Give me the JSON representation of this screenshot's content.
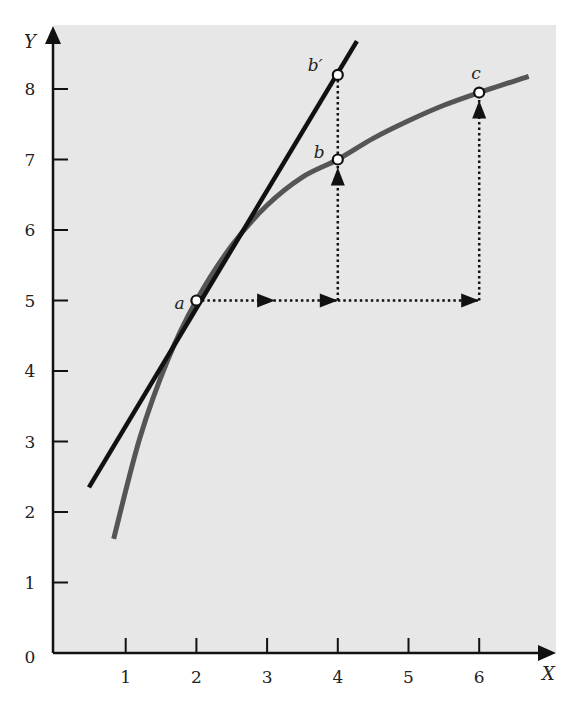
{
  "chart_data": {
    "type": "line",
    "title": "",
    "xlabel": "X",
    "ylabel": "Y",
    "xlim": [
      0,
      7
    ],
    "ylim": [
      0,
      8.8
    ],
    "grid": false,
    "x_ticks": [
      1,
      2,
      3,
      4,
      5,
      6
    ],
    "y_ticks": [
      0,
      1,
      2,
      3,
      4,
      5,
      6,
      7,
      8
    ],
    "series": [
      {
        "name": "curve",
        "kind": "concave-curve",
        "color": "#555555",
        "x": [
          0.83,
          1.2,
          1.6,
          2.0,
          2.5,
          3.0,
          3.5,
          4.0,
          4.5,
          5.0,
          5.5,
          6.0,
          6.7
        ],
        "y": [
          1.62,
          3.05,
          4.17,
          5.0,
          5.78,
          6.35,
          6.75,
          7.0,
          7.3,
          7.55,
          7.77,
          7.95,
          8.18
        ]
      },
      {
        "name": "tangent-line",
        "kind": "straight-line",
        "color": "#111111",
        "x": [
          0.48,
          4.27
        ],
        "y": [
          2.35,
          8.68
        ]
      }
    ],
    "points": [
      {
        "label": "a",
        "x": 2,
        "y": 5.0
      },
      {
        "label": "b",
        "x": 4,
        "y": 7.0
      },
      {
        "label": "b′",
        "x": 4,
        "y": 8.2
      },
      {
        "label": "c",
        "x": 6,
        "y": 7.95
      }
    ],
    "annotations": [
      {
        "type": "dotted-arrow-horizontal",
        "from": [
          2,
          5
        ],
        "to": [
          4,
          5
        ]
      },
      {
        "type": "dotted-arrow-horizontal",
        "from": [
          4,
          5
        ],
        "to": [
          6,
          5
        ]
      },
      {
        "type": "dotted-arrow-vertical",
        "from": [
          4,
          5
        ],
        "to": [
          4,
          7
        ]
      },
      {
        "type": "dotted-line-vertical",
        "from": [
          4,
          7
        ],
        "to": [
          4,
          8.2
        ]
      },
      {
        "type": "dotted-arrow-vertical",
        "from": [
          6,
          5
        ],
        "to": [
          6,
          7.95
        ]
      }
    ]
  },
  "labels": {
    "x_axis": "X",
    "y_axis": "Y",
    "origin": "0"
  }
}
